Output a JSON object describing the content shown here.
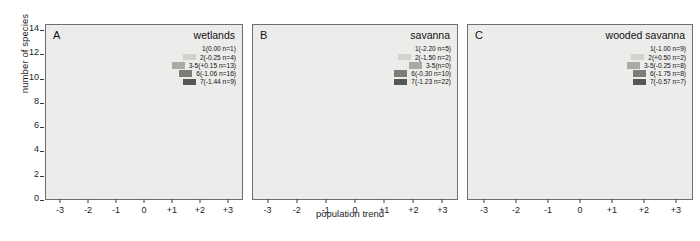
{
  "axes": {
    "ylabel": "number of species",
    "xlabel": "population trend",
    "yticks": [
      "0",
      "2",
      "4",
      "6",
      "8",
      "10",
      "12",
      "14"
    ],
    "ylim": [
      0,
      14
    ],
    "xticks": [
      "-3",
      "-2",
      "-1",
      "0",
      "+1",
      "+2",
      "+3"
    ]
  },
  "colors": {
    "cat1": "#f2f2f0",
    "cat2": "#d2d2cf",
    "cat3": "#a9a9a5",
    "cat6": "#7c7c79",
    "cat7": "#565654",
    "panel_bg": "#ececea",
    "axis": "#6e6e6e"
  },
  "panels": [
    {
      "tag": "A",
      "title": "wetlands",
      "legend": [
        {
          "label": "1(0.00 n=1)",
          "swatch": "cat1",
          "hide_swatch": true
        },
        {
          "label": "2(-0.25 n=4)",
          "swatch": "cat2",
          "hide_swatch": false
        },
        {
          "label": "3-5(+0.15 n=13)",
          "swatch": "cat3",
          "hide_swatch": false
        },
        {
          "label": "6(-1.06 n=16)",
          "swatch": "cat6",
          "hide_swatch": false
        },
        {
          "label": "7(-1.44 n=9)",
          "swatch": "cat7",
          "hide_swatch": false
        }
      ]
    },
    {
      "tag": "B",
      "title": "savanna",
      "legend": [
        {
          "label": "1(-2.20 n=5)",
          "swatch": "cat1",
          "hide_swatch": true
        },
        {
          "label": "2(-1.50 n=2)",
          "swatch": "cat2",
          "hide_swatch": false
        },
        {
          "label": "3-5(n=0)",
          "swatch": "cat3",
          "hide_swatch": false
        },
        {
          "label": "6(-0.30 n=10)",
          "swatch": "cat6",
          "hide_swatch": false
        },
        {
          "label": "7(-1.23 n=22)",
          "swatch": "cat7",
          "hide_swatch": false
        }
      ]
    },
    {
      "tag": "C",
      "title": "wooded savanna",
      "legend": [
        {
          "label": "1(-1.00 n=9)",
          "swatch": "cat1",
          "hide_swatch": true
        },
        {
          "label": "2(+0.50 n=2)",
          "swatch": "cat2",
          "hide_swatch": false
        },
        {
          "label": "3-5(-0.25 n=8)",
          "swatch": "cat3",
          "hide_swatch": false
        },
        {
          "label": "6(-1.75 n=8)",
          "swatch": "cat6",
          "hide_swatch": false
        },
        {
          "label": "7(-0.57 n=7)",
          "swatch": "cat7",
          "hide_swatch": false
        }
      ]
    }
  ],
  "chart_data": {
    "type": "bar",
    "title": "",
    "xlabel": "population trend",
    "ylabel": "number of species",
    "ylim": [
      0,
      14
    ],
    "grid": false,
    "legend_position": "top-right inside each panel",
    "stacked": true,
    "categories": [
      "-3",
      "-2",
      "-1",
      "0",
      "+1",
      "+2",
      "+3"
    ],
    "panels": [
      {
        "tag": "A",
        "name": "wetlands",
        "series": [
          {
            "name": "7(-1.44 n=9)",
            "color": "cat7",
            "values": [
              2,
              3,
              1,
              3,
              1,
              1,
              0
            ]
          },
          {
            "name": "6(-1.06 n=16)",
            "color": "cat6",
            "values": [
              1,
              6,
              5,
              2,
              0,
              0,
              0
            ]
          },
          {
            "name": "3-5(+0.15 n=13)",
            "color": "cat3",
            "values": [
              0,
              0,
              3,
              7,
              1,
              2,
              0
            ]
          },
          {
            "name": "2(-0.25 n=4)",
            "color": "cat2",
            "values": [
              0,
              1,
              1,
              1,
              0,
              1,
              0
            ]
          },
          {
            "name": "1(0.00 n=1)",
            "color": "cat1",
            "values": [
              0,
              0,
              0,
              0,
              0,
              0,
              0
            ]
          }
        ],
        "totals": [
          3,
          10,
          10,
          13,
          2,
          4,
          0
        ]
      },
      {
        "tag": "B",
        "name": "savanna",
        "series": [
          {
            "name": "7(-1.23 n=22)",
            "color": "cat7",
            "values": [
              3,
              7,
              4,
              6,
              2,
              1,
              0
            ]
          },
          {
            "name": "6(-0.30 n=10)",
            "color": "cat6",
            "values": [
              0,
              2,
              3,
              4,
              0,
              0,
              0
            ]
          },
          {
            "name": "3-5(n=0)",
            "color": "cat3",
            "values": [
              0,
              0,
              0,
              0,
              0,
              0,
              0
            ]
          },
          {
            "name": "2(-1.50 n=2)",
            "color": "cat2",
            "values": [
              1,
              0,
              0,
              1,
              0,
              0,
              0
            ]
          },
          {
            "name": "1(-2.20 n=5)",
            "color": "cat1",
            "values": [
              0,
              0,
              0,
              0,
              0,
              0,
              0
            ]
          }
        ],
        "totals": [
          4,
          9,
          7,
          11,
          2,
          1,
          0
        ]
      },
      {
        "tag": "C",
        "name": "wooded savanna",
        "series": [
          {
            "name": "7(-0.57 n=7)",
            "color": "cat7",
            "values": [
              2,
              3,
              1,
              1,
              1,
              1,
              0
            ]
          },
          {
            "name": "6(-1.75 n=8)",
            "color": "cat6",
            "values": [
              0,
              2,
              4,
              0,
              0,
              0,
              0
            ]
          },
          {
            "name": "3-5(-0.25 n=8)",
            "color": "cat3",
            "values": [
              0,
              0,
              2,
              6,
              0,
              0,
              0
            ]
          },
          {
            "name": "2(+0.50 n=2)",
            "color": "cat2",
            "values": [
              0,
              0,
              0,
              1,
              1,
              0,
              0
            ]
          },
          {
            "name": "1(-1.00 n=9)",
            "color": "cat1",
            "values": [
              0,
              0,
              0,
              0,
              0,
              0,
              0
            ]
          }
        ],
        "totals": [
          2,
          5,
          7,
          8,
          2,
          1,
          0
        ]
      }
    ]
  }
}
